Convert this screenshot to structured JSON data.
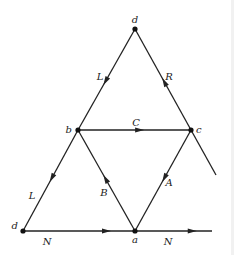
{
  "diagram": {
    "type": "directed-graph",
    "nodes": [
      {
        "id": "d_top",
        "label": "d",
        "x": 135,
        "y": 29,
        "label_dx": 0,
        "label_dy": -6,
        "anchor": "middle"
      },
      {
        "id": "b",
        "label": "b",
        "x": 78,
        "y": 130,
        "label_dx": -6,
        "label_dy": 3,
        "anchor": "end"
      },
      {
        "id": "c",
        "label": "c",
        "x": 191,
        "y": 130,
        "label_dx": 5,
        "label_dy": 3,
        "anchor": "start"
      },
      {
        "id": "d_bottom",
        "label": "d",
        "x": 23,
        "y": 231,
        "label_dx": -5,
        "label_dy": -2,
        "anchor": "end"
      },
      {
        "id": "a",
        "label": "a",
        "x": 135,
        "y": 231,
        "label_dx": 0,
        "label_dy": 12,
        "anchor": "middle"
      }
    ],
    "edges": [
      {
        "id": "L_top",
        "label": "L",
        "from": [
          135,
          29
        ],
        "to": [
          78,
          130
        ],
        "arrow_t": 0.52,
        "label_pos": [
          100,
          80
        ],
        "anchor": "middle"
      },
      {
        "id": "R",
        "label": "R",
        "from": [
          191,
          130
        ],
        "to": [
          135,
          29
        ],
        "arrow_t": 0.48,
        "label_pos": [
          169,
          80
        ],
        "anchor": "middle"
      },
      {
        "id": "C",
        "label": "C",
        "from": [
          78,
          130
        ],
        "to": [
          191,
          130
        ],
        "arrow_t": 0.55,
        "label_pos": [
          136,
          126
        ],
        "anchor": "middle"
      },
      {
        "id": "L_bottom",
        "label": "L",
        "from": [
          78,
          130
        ],
        "to": [
          23,
          231
        ],
        "arrow_t": 0.48,
        "label_pos": [
          32,
          199
        ],
        "anchor": "middle"
      },
      {
        "id": "B",
        "label": "B",
        "from": [
          135,
          231
        ],
        "to": [
          78,
          130
        ],
        "arrow_t": 0.52,
        "label_pos": [
          104,
          196
        ],
        "anchor": "middle"
      },
      {
        "id": "A",
        "label": "A",
        "from": [
          191,
          130
        ],
        "to": [
          135,
          231
        ],
        "arrow_t": 0.48,
        "label_pos": [
          169,
          186
        ],
        "anchor": "middle"
      },
      {
        "id": "N_left",
        "label": "N",
        "from": [
          23,
          231
        ],
        "to": [
          135,
          231
        ],
        "arrow_t": 0.75,
        "label_pos": [
          47,
          245
        ],
        "anchor": "middle"
      },
      {
        "id": "N_right",
        "label": "N",
        "from": [
          135,
          231
        ],
        "to": [
          212,
          231
        ],
        "arrow_t": 0.75,
        "label_pos": [
          168,
          245
        ],
        "anchor": "middle"
      },
      {
        "id": "tail_c",
        "label": "",
        "from": [
          191,
          130
        ],
        "to": [
          216,
          175
        ],
        "arrow_t": null,
        "label_pos": null,
        "anchor": "middle"
      }
    ]
  }
}
